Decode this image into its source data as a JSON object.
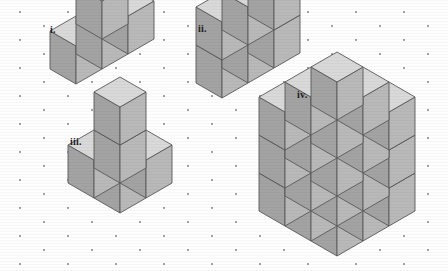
{
  "page": {
    "kind": "geometry-figure-sheet",
    "width": 448,
    "height": 271,
    "background_color": "#fefefe"
  },
  "palette": {
    "top_face": "#d9d9d9",
    "right_face": "#b9b9b9",
    "left_face": "#a3a3a3",
    "outline": "#3c3c3c",
    "inner_edge": "#5a5a5a",
    "dot": "#555555",
    "background": "#fefefe"
  },
  "grid": {
    "type": "isometric-dot-lattice",
    "dot_radius": 0.9,
    "column_spacing": 48,
    "row_spacing": 28,
    "stagger_x": 24,
    "stagger_y": 14
  },
  "projection": {
    "type": "isometric",
    "cube_half_width": 26,
    "cube_rise": 15,
    "cube_height": 38
  },
  "figures": [
    {
      "id": "figure-i",
      "label": "i.",
      "label_x": 50,
      "label_y": 24,
      "origin_x": 76,
      "origin_y": 84,
      "cube_count": 4,
      "shape": "L-shaped row of three cubes with one cube set behind the right end",
      "cells": [
        {
          "x": 0,
          "y": 0,
          "z": 0
        },
        {
          "x": 1,
          "y": 0,
          "z": 0
        },
        {
          "x": 2,
          "y": 0,
          "z": 0
        },
        {
          "x": 2,
          "y": 1,
          "z": 0
        }
      ]
    },
    {
      "id": "figure-ii",
      "label": "ii.",
      "label_x": 198,
      "label_y": 23,
      "origin_x": 222,
      "origin_y": 98,
      "cube_count": 6,
      "shape": "Slab three cubes wide, one deep and two cubes tall",
      "cells": [
        {
          "x": 0,
          "y": 0,
          "z": 0
        },
        {
          "x": 1,
          "y": 0,
          "z": 0
        },
        {
          "x": 2,
          "y": 0,
          "z": 0
        },
        {
          "x": 0,
          "y": 0,
          "z": 1
        },
        {
          "x": 1,
          "y": 0,
          "z": 1
        },
        {
          "x": 2,
          "y": 0,
          "z": 1
        }
      ]
    },
    {
      "id": "figure-iii",
      "label": "iii.",
      "label_x": 70,
      "label_y": 136,
      "origin_x": 120,
      "origin_y": 213,
      "cube_count": 5,
      "shape": "Two by two square base with a single cube stacked on the back corner",
      "cells": [
        {
          "x": 0,
          "y": 0,
          "z": 0
        },
        {
          "x": 1,
          "y": 0,
          "z": 0
        },
        {
          "x": 0,
          "y": 1,
          "z": 0
        },
        {
          "x": 1,
          "y": 1,
          "z": 0
        },
        {
          "x": 1,
          "y": 1,
          "z": 1
        }
      ]
    },
    {
      "id": "figure-iv",
      "label": "iv.",
      "label_x": 297,
      "label_y": 89,
      "origin_x": 337,
      "origin_y": 256,
      "cube_count": 27,
      "shape": "Solid three by three by three cube",
      "dimensions": {
        "width": 3,
        "depth": 3,
        "height": 3
      }
    }
  ]
}
